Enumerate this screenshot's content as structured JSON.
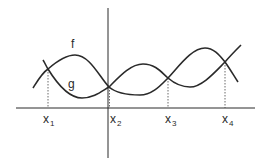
{
  "diagram": {
    "type": "function-intersection-graph",
    "curves": [
      {
        "name": "f",
        "label": "f",
        "label_pos": [
          71,
          48
        ]
      },
      {
        "name": "g",
        "label": "g",
        "label_pos": [
          68,
          88
        ]
      }
    ],
    "intersections": [
      {
        "label": "x",
        "subscript": "1",
        "x": 48,
        "y": 69,
        "label_x": 43
      },
      {
        "label": "x",
        "subscript": "2",
        "x": 109,
        "y": 87,
        "label_x": 109
      },
      {
        "label": "x",
        "subscript": "3",
        "x": 168,
        "y": 78,
        "label_x": 165
      },
      {
        "label": "x",
        "subscript": "4",
        "x": 225,
        "y": 62,
        "label_x": 222
      }
    ],
    "axes": {
      "x_axis_y": 108,
      "y_axis_x": 108
    },
    "colors": {
      "stroke": "#2a2a2a",
      "background": "#ffffff"
    }
  }
}
